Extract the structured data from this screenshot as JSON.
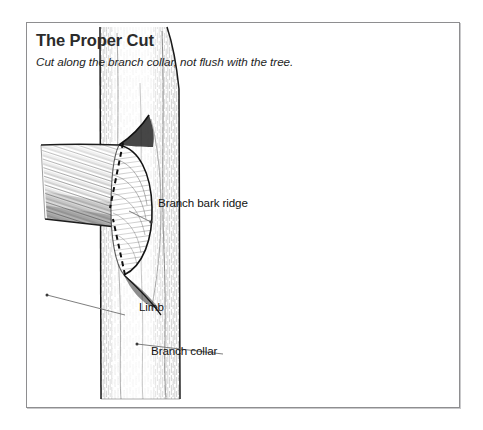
{
  "figure": {
    "title": "The Proper Cut",
    "subtitle": "Cut along the branch collar, not flush with the tree.",
    "labels": [
      {
        "id": "branch-bark-ridge",
        "text": "Branch bark ridge"
      },
      {
        "id": "limb",
        "text": "Limb"
      },
      {
        "id": "branch-collar",
        "text": "Branch collar"
      }
    ],
    "illustration": {
      "name": "tree-branch-pruning-cut-diagram",
      "parts": [
        "tree-trunk",
        "limb-stub",
        "branch-collar",
        "branch-bark-ridge",
        "dashed-cut-line-upper",
        "dashed-cut-line-lower"
      ]
    },
    "colors": {
      "ink": "#121212",
      "title": "#2b2b2b",
      "frame_border": "#8e8e90",
      "frame_shadow": "#c9c9cb",
      "background": "#ffffff",
      "bark_dark": "#2a2a2a",
      "bark_mid": "#6e6e6e",
      "collar_light": "#f2f2f2"
    }
  }
}
